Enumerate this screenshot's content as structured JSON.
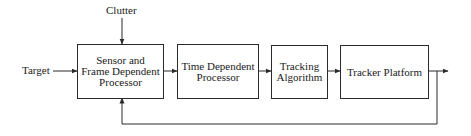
{
  "diagram": {
    "type": "block-diagram",
    "inputs": {
      "clutter": "Clutter",
      "target": "Target"
    },
    "blocks": [
      {
        "id": "sensor",
        "lines": [
          "Sensor and",
          "Frame Dependent",
          "Processor"
        ]
      },
      {
        "id": "time",
        "lines": [
          "Time Dependent",
          "Processor"
        ]
      },
      {
        "id": "tracking",
        "lines": [
          "Tracking",
          "Algorithm"
        ]
      },
      {
        "id": "platform",
        "lines": [
          "Tracker Platform"
        ]
      }
    ],
    "connections": [
      {
        "from": "Clutter",
        "to": "Sensor and Frame Dependent Processor"
      },
      {
        "from": "Target",
        "to": "Sensor and Frame Dependent Processor"
      },
      {
        "from": "Sensor and Frame Dependent Processor",
        "to": "Time Dependent Processor"
      },
      {
        "from": "Time Dependent Processor",
        "to": "Tracking Algorithm"
      },
      {
        "from": "Tracking Algorithm",
        "to": "Tracker Platform"
      },
      {
        "from": "Tracker Platform",
        "to": "output"
      },
      {
        "from": "Tracker Platform",
        "to": "Sensor and Frame Dependent Processor",
        "kind": "feedback"
      }
    ],
    "line_color": "#2a2a2a"
  }
}
